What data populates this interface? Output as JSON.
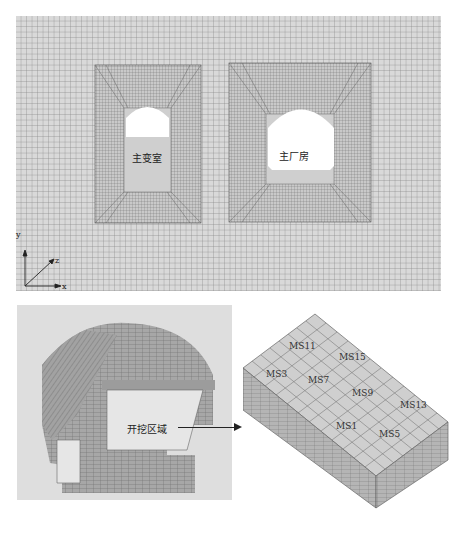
{
  "figure": {
    "top_text_cropped": "",
    "top_mesh": {
      "cavern_labels": [
        {
          "id": "transformer-chamber",
          "label": "主变室"
        },
        {
          "id": "main-powerhouse",
          "label": "主厂房"
        }
      ],
      "axes": {
        "y": "y",
        "z": "z",
        "x": "x"
      },
      "colors": {
        "background": "#d6d6d6",
        "grid_line": "#7a7a7a",
        "cavern": "#ffffff"
      }
    },
    "bottom_left": {
      "region_label": "开挖区域",
      "arrow": "right-arrow",
      "colors": {
        "background": "#dedede",
        "mesh": "#9a9a9a",
        "excavation": "#e6e6e6"
      }
    },
    "bottom_right": {
      "monitoring_points": [
        "MS11",
        "MS15",
        "MS3",
        "MS7",
        "MS9",
        "MS13",
        "MS1",
        "MS5"
      ],
      "colors": {
        "top_face": "#cfcfcf",
        "side_face": "#b3b3b3",
        "grid_line": "#6e6e6e"
      }
    },
    "caption": ""
  }
}
